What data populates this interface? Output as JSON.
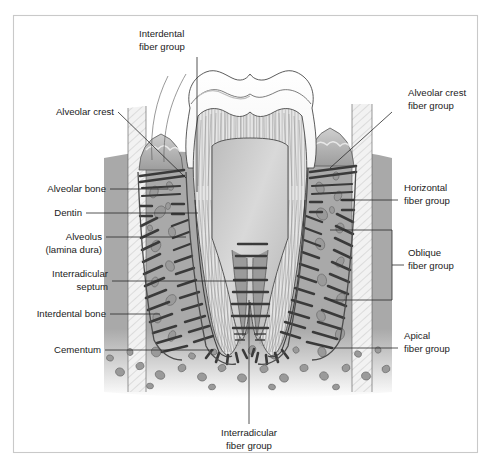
{
  "figure": {
    "frame_color": "#c9c9c9",
    "background": "#ffffff",
    "text_color": "#1b1b1b",
    "leader_color": "#2a2a2a"
  },
  "labels": {
    "interdental_fiber_group": {
      "line1": "Interdental",
      "line2": "fiber group"
    },
    "alveolar_crest": {
      "line1": "Alveolar crest",
      "line2": ""
    },
    "alveolar_bone": {
      "line1": "Alveolar bone",
      "line2": ""
    },
    "dentin": {
      "line1": "Dentin",
      "line2": ""
    },
    "alveolus": {
      "line1": "Alveolus",
      "line2": "(lamina dura)"
    },
    "interradicular_septum": {
      "line1": "Interradicular",
      "line2": "septum"
    },
    "interdental_bone": {
      "line1": "Interdental bone",
      "line2": ""
    },
    "cementum": {
      "line1": "Cementum",
      "line2": ""
    },
    "alveolar_crest_fiber_group": {
      "line1": "Alveolar crest",
      "line2": "fiber group"
    },
    "horizontal_fiber_group": {
      "line1": "Horizontal",
      "line2": "fiber group"
    },
    "oblique_fiber_group": {
      "line1": "Oblique",
      "line2": "fiber group"
    },
    "apical_fiber_group": {
      "line1": "Apical",
      "line2": "fiber group"
    },
    "interradicular_fiber_group": {
      "line1": "Interradicular",
      "line2": "fiber group"
    }
  },
  "anatomy": {
    "enamel": {
      "name": "enamel",
      "color": "#fbfbfb"
    },
    "dentin": {
      "name": "dentin",
      "color": "#e3e3e3"
    },
    "pulp": {
      "name": "pulp-chamber",
      "color": "#c6c6c6"
    },
    "bone": {
      "name": "alveolar-bone",
      "color": "#a9a9a9"
    },
    "trabeculae": {
      "name": "trabeculae",
      "color": "#8e8e8e"
    },
    "gingiva": {
      "name": "gingiva",
      "color": "#b6b6b6"
    },
    "pdl_fibers": {
      "name": "periodontal-ligament-fibers",
      "color": "#3c3c3c"
    },
    "lamina_dura": {
      "name": "lamina-dura",
      "color": "#5a5a5a"
    }
  }
}
